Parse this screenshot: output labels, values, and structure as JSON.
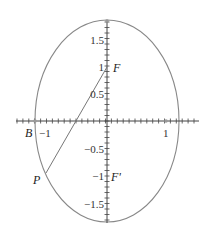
{
  "diagram": {
    "type": "ellipse-with-foci",
    "colors": {
      "curve": "#888888",
      "axis": "#444444",
      "text": "#222222",
      "line": "#777777"
    },
    "points": {
      "F": {
        "label": "F",
        "x": 0,
        "y": 1
      },
      "F_prime": {
        "label": "F'",
        "x": 0,
        "y": -1
      },
      "B": {
        "label": "B",
        "x": -1.2,
        "y": 0
      },
      "P": {
        "label": "P",
        "x": -1.02,
        "y": -0.95
      }
    },
    "segment": {
      "from": "P",
      "to": "F"
    },
    "x_ticks": [
      {
        "value": -1,
        "label": "−1"
      },
      {
        "value": 1,
        "label": "1"
      }
    ],
    "y_ticks": [
      {
        "value": 1.5,
        "label": "1.5"
      },
      {
        "value": 1,
        "label": "1"
      },
      {
        "value": 0.5,
        "label": "0.5"
      },
      {
        "value": -0.5,
        "label": "−0.5"
      },
      {
        "value": -1,
        "label": "−1"
      },
      {
        "value": -1.5,
        "label": "−1.5"
      }
    ]
  }
}
